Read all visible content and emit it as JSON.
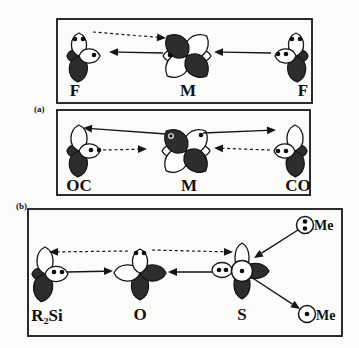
{
  "figure": {
    "width": 359,
    "height": 348,
    "colors": {
      "background": "#fbfbf9",
      "stroke": "#151515",
      "lobe_dark": "#2d2d2d",
      "lobe_light": "#ffffff"
    },
    "boxes": [
      {
        "name": "panel-a-box-fmf",
        "x": 57,
        "y": 19,
        "w": 255,
        "h": 84
      },
      {
        "name": "panel-a-box-ocmco",
        "x": 57,
        "y": 110,
        "w": 253,
        "h": 85
      },
      {
        "name": "panel-b-box",
        "x": 28,
        "y": 209,
        "w": 314,
        "h": 127
      }
    ],
    "clusters": [
      {
        "name": "orbital-f-left",
        "x": 79,
        "y": 56,
        "lobes": [
          {
            "angle": 270,
            "len": 12,
            "wid": 11,
            "fill": "dark"
          },
          {
            "angle": 183,
            "len": 26,
            "wid": 18,
            "fill": "dark"
          },
          {
            "angle": 0,
            "len": 23,
            "wid": 15,
            "fill": "light"
          },
          {
            "angle": 90,
            "len": 21,
            "wid": 14,
            "fill": "light"
          }
        ],
        "dots": [
          {
            "x": 75,
            "y": 39
          },
          {
            "x": 83,
            "y": 39
          },
          {
            "x": 94,
            "y": 55
          }
        ]
      },
      {
        "name": "orbital-m-top",
        "x": 187,
        "y": 56,
        "lobes": [
          {
            "angle": 270,
            "len": 24,
            "wid": 13,
            "fill": "light"
          },
          {
            "angle": 90,
            "len": 24,
            "wid": 13,
            "fill": "light"
          },
          {
            "angle": 45,
            "len": 28,
            "wid": 21,
            "fill": "light"
          },
          {
            "angle": 225,
            "len": 28,
            "wid": 21,
            "fill": "light"
          },
          {
            "angle": 315,
            "len": 28,
            "wid": 21,
            "fill": "dark"
          },
          {
            "angle": 135,
            "len": 28,
            "wid": 21,
            "fill": "dark"
          }
        ],
        "dots": [
          {
            "x": 170,
            "y": 55
          }
        ]
      },
      {
        "name": "orbital-f-right",
        "x": 296,
        "y": 56,
        "lobes": [
          {
            "angle": 90,
            "len": 12,
            "wid": 11,
            "fill": "dark"
          },
          {
            "angle": 177,
            "len": 26,
            "wid": 18,
            "fill": "dark"
          },
          {
            "angle": 0,
            "len": 23,
            "wid": 15,
            "fill": "light"
          },
          {
            "angle": 270,
            "len": 21,
            "wid": 14,
            "fill": "light"
          }
        ],
        "dots": [
          {
            "x": 292,
            "y": 39
          },
          {
            "x": 300,
            "y": 39
          },
          {
            "x": 278,
            "y": 54
          },
          {
            "x": 286,
            "y": 54
          }
        ]
      },
      {
        "name": "orbital-oc",
        "x": 79,
        "y": 151,
        "lobes": [
          {
            "angle": 270,
            "len": 12,
            "wid": 11,
            "fill": "dark"
          },
          {
            "angle": 183,
            "len": 26,
            "wid": 18,
            "fill": "dark"
          },
          {
            "angle": 0,
            "len": 26,
            "wid": 16,
            "fill": "light"
          },
          {
            "angle": 90,
            "len": 21,
            "wid": 14,
            "fill": "light"
          }
        ],
        "dots": [
          {
            "x": 91,
            "y": 150
          },
          {
            "x": 99,
            "y": 150
          }
        ]
      },
      {
        "name": "orbital-m-bottom",
        "x": 186,
        "y": 151,
        "lobes": [
          {
            "angle": 270,
            "len": 24,
            "wid": 13,
            "fill": "light"
          },
          {
            "angle": 90,
            "len": 24,
            "wid": 13,
            "fill": "light"
          },
          {
            "angle": 45,
            "len": 28,
            "wid": 21,
            "fill": "light"
          },
          {
            "angle": 225,
            "len": 28,
            "wid": 21,
            "fill": "light"
          },
          {
            "angle": 315,
            "len": 28,
            "wid": 21,
            "fill": "dark"
          },
          {
            "angle": 135,
            "len": 28,
            "wid": 21,
            "fill": "dark"
          }
        ],
        "dots": [
          {
            "x": 171,
            "y": 136,
            "ring": true
          },
          {
            "x": 201,
            "y": 135
          }
        ]
      },
      {
        "name": "orbital-co",
        "x": 295,
        "y": 151,
        "lobes": [
          {
            "angle": 90,
            "len": 12,
            "wid": 11,
            "fill": "dark"
          },
          {
            "angle": 179,
            "len": 26,
            "wid": 18,
            "fill": "dark"
          },
          {
            "angle": 0,
            "len": 26,
            "wid": 16,
            "fill": "light"
          },
          {
            "angle": 270,
            "len": 21,
            "wid": 14,
            "fill": "light"
          }
        ],
        "dots": [
          {
            "x": 278,
            "y": 151
          },
          {
            "x": 286,
            "y": 151
          }
        ]
      },
      {
        "name": "orbital-r2si",
        "x": 45,
        "y": 274,
        "lobes": [
          {
            "angle": 270,
            "len": 13,
            "wid": 11,
            "fill": "dark"
          },
          {
            "angle": 188,
            "len": 28,
            "wid": 19,
            "fill": "dark"
          },
          {
            "angle": 0,
            "len": 27,
            "wid": 16,
            "fill": "light"
          },
          {
            "angle": 90,
            "len": 23,
            "wid": 15,
            "fill": "light"
          }
        ],
        "dots": [
          {
            "x": 54,
            "y": 272
          },
          {
            "x": 62,
            "y": 272
          }
        ]
      },
      {
        "name": "orbital-o",
        "x": 140,
        "y": 273,
        "lobes": [
          {
            "angle": 180,
            "len": 27,
            "wid": 17,
            "fill": "dark"
          },
          {
            "angle": 90,
            "len": 26,
            "wid": 16,
            "fill": "dark"
          },
          {
            "angle": 270,
            "len": 26,
            "wid": 16,
            "fill": "light"
          },
          {
            "angle": 0,
            "len": 24,
            "wid": 15,
            "fill": "light"
          }
        ],
        "dots": [
          {
            "x": 136,
            "y": 253
          },
          {
            "x": 144,
            "y": 253
          }
        ]
      },
      {
        "name": "orbital-s",
        "x": 242,
        "y": 271,
        "lobes": [
          {
            "angle": 0,
            "len": 28,
            "wid": 14,
            "fill": "light"
          },
          {
            "angle": 90,
            "len": 27,
            "wid": 15,
            "fill": "dark"
          },
          {
            "angle": 180,
            "len": 28,
            "wid": 16,
            "fill": "dark"
          }
        ],
        "ellipse": {
          "cx": 222,
          "cy": 270,
          "rx": 10,
          "ry": 7.5
        },
        "circle": {
          "r": 10.5
        },
        "dots": [
          {
            "x": 219,
            "y": 270
          },
          {
            "x": 226,
            "y": 270
          },
          {
            "x": 242,
            "y": 271
          }
        ]
      },
      {
        "name": "lone-pair-me-top",
        "x": 305,
        "y": 225,
        "lobes": [],
        "circle": {
          "r": 8.5
        },
        "dots": [
          {
            "x": 305,
            "y": 221.5
          },
          {
            "x": 305,
            "y": 228.5
          }
        ]
      },
      {
        "name": "radical-me-bottom",
        "x": 307,
        "y": 314,
        "lobes": [],
        "circle": {
          "r": 8.5
        },
        "dots": [
          {
            "x": 307,
            "y": 314
          }
        ]
      }
    ],
    "arrows": [
      {
        "name": "arrow-pi-donation-f-to-m",
        "style": "dashed",
        "x1": 93,
        "y1": 32,
        "x2": 166,
        "y2": 38
      },
      {
        "name": "arrow-pairing-m-to-f",
        "style": "solid",
        "x1": 163,
        "y1": 53,
        "x2": 109,
        "y2": 52
      },
      {
        "name": "arrow-sigma-donation-f-to-m",
        "style": "solid",
        "x1": 271,
        "y1": 53,
        "x2": 214,
        "y2": 52
      },
      {
        "name": "arrow-backdonation-m-to-oc",
        "style": "solid",
        "x1": 166,
        "y1": 134,
        "x2": 83,
        "y2": 128
      },
      {
        "name": "arrow-sigma-donation-oc-to-m",
        "style": "dashed",
        "x1": 103,
        "y1": 150,
        "x2": 147,
        "y2": 149
      },
      {
        "name": "arrow-backdonation-m-to-co",
        "style": "solid",
        "x1": 203,
        "y1": 133,
        "x2": 276,
        "y2": 130
      },
      {
        "name": "arrow-sigma-donation-co-to-m",
        "style": "dashed",
        "x1": 270,
        "y1": 150,
        "x2": 214,
        "y2": 148
      },
      {
        "name": "arrow-backdonation-o-to-si",
        "style": "dashed",
        "x1": 128,
        "y1": 251,
        "x2": 49,
        "y2": 252
      },
      {
        "name": "arrow-backdonation-o-to-s",
        "style": "dashed",
        "x1": 152,
        "y1": 250,
        "x2": 233,
        "y2": 252
      },
      {
        "name": "arrow-sigma-donation-si-to-o",
        "style": "solid",
        "x1": 67,
        "y1": 272,
        "x2": 113,
        "y2": 271
      },
      {
        "name": "arrow-sigma-donation-s-to-o",
        "style": "solid",
        "x1": 213,
        "y1": 272,
        "x2": 168,
        "y2": 272
      },
      {
        "name": "arrow-me-to-s",
        "style": "solid",
        "x1": 298,
        "y1": 230,
        "x2": 254,
        "y2": 258
      },
      {
        "name": "arrow-s-to-me",
        "style": "solid",
        "x1": 251,
        "y1": 277,
        "x2": 300,
        "y2": 309
      }
    ],
    "labels": [
      {
        "name": "panel-a-label",
        "text": "(a)",
        "x": 34,
        "y": 112,
        "size": 9,
        "anchor": "start"
      },
      {
        "name": "panel-b-label",
        "text": "(b)",
        "x": 16,
        "y": 209,
        "size": 9,
        "anchor": "start"
      },
      {
        "name": "atom-label-f-left",
        "text": "F",
        "x": 75,
        "y": 96,
        "size": 17,
        "anchor": "middle"
      },
      {
        "name": "atom-label-m-top",
        "text": "M",
        "x": 188,
        "y": 96,
        "size": 17,
        "anchor": "middle"
      },
      {
        "name": "atom-label-f-right",
        "text": "F",
        "x": 303,
        "y": 96,
        "size": 17,
        "anchor": "middle"
      },
      {
        "name": "atom-label-oc",
        "text": "OC",
        "x": 79,
        "y": 191,
        "size": 17,
        "anchor": "middle"
      },
      {
        "name": "atom-label-m-bottom",
        "text": "M",
        "x": 189,
        "y": 191,
        "size": 17,
        "anchor": "middle"
      },
      {
        "name": "atom-label-co",
        "text": "CO",
        "x": 298,
        "y": 191,
        "size": 17,
        "anchor": "middle"
      },
      {
        "name": "atom-label-r2si",
        "text": "R₂Si",
        "x": 47,
        "y": 321,
        "size": 17,
        "anchor": "middle"
      },
      {
        "name": "atom-label-o",
        "text": "O",
        "x": 140,
        "y": 320,
        "size": 17,
        "anchor": "middle"
      },
      {
        "name": "atom-label-s",
        "text": "S",
        "x": 242,
        "y": 320,
        "size": 17,
        "anchor": "middle"
      },
      {
        "name": "me-label-top",
        "text": "Me",
        "x": 314,
        "y": 230,
        "size": 14,
        "anchor": "start"
      },
      {
        "name": "me-label-bottom",
        "text": "Me",
        "x": 316,
        "y": 320,
        "size": 14,
        "anchor": "start"
      }
    ]
  }
}
